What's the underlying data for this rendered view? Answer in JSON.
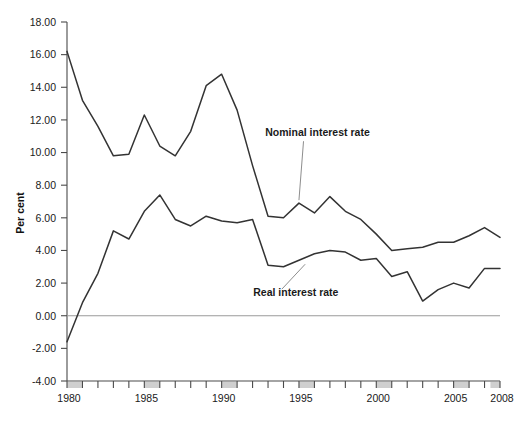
{
  "chart_data": {
    "type": "line",
    "title": "",
    "xlabel": "",
    "ylabel": "Per cent",
    "ylim": [
      -4.0,
      18.0
    ],
    "xlim": [
      1980,
      2008
    ],
    "ytick_step": 2.0,
    "grid": false,
    "legend_position": "inline-annotations",
    "ytick_labels": [
      "18.00",
      "16.00",
      "14.00",
      "12.00",
      "10.00",
      "8.00",
      "6.00",
      "4.00",
      "2.00",
      "0.00",
      "-2.00",
      "-4.00"
    ],
    "ytick_values": [
      18,
      16,
      14,
      12,
      10,
      8,
      6,
      4,
      2,
      0,
      -2,
      -4
    ],
    "xtick_labels": [
      "1980",
      "1985",
      "1990",
      "1995",
      "2000",
      "2005",
      "2008"
    ],
    "xtick_values": [
      1980,
      1985,
      1990,
      1995,
      2000,
      2005,
      2008
    ],
    "x_minor_step": 1,
    "highlighted_years": [
      1980,
      1985,
      1990,
      1995,
      2000,
      2005,
      2008
    ],
    "x": [
      1980,
      1981,
      1982,
      1983,
      1984,
      1985,
      1986,
      1987,
      1988,
      1989,
      1990,
      1991,
      1992,
      1993,
      1994,
      1995,
      1996,
      1997,
      1998,
      1999,
      2000,
      2001,
      2002,
      2003,
      2004,
      2005,
      2006,
      2007,
      2008
    ],
    "series": [
      {
        "name": "Nominal interest rate",
        "color": "#333333",
        "values": [
          16.2,
          13.2,
          11.6,
          9.8,
          9.9,
          12.3,
          10.4,
          9.8,
          11.3,
          14.1,
          14.8,
          12.6,
          9.2,
          6.1,
          6.0,
          6.9,
          6.3,
          7.3,
          6.4,
          5.9,
          5.0,
          4.0,
          4.1,
          4.2,
          4.5,
          4.5,
          4.9,
          5.4,
          4.8
        ]
      },
      {
        "name": "Real interest rate",
        "color": "#333333",
        "values": [
          -1.6,
          0.8,
          2.6,
          5.2,
          4.7,
          6.4,
          7.4,
          5.9,
          5.5,
          6.1,
          5.8,
          5.7,
          5.9,
          3.1,
          3.0,
          3.4,
          3.8,
          4.0,
          3.9,
          3.4,
          3.5,
          2.4,
          2.7,
          0.9,
          1.6,
          2.0,
          1.7,
          2.9,
          2.9
        ]
      }
    ],
    "annotations": [
      {
        "text": "Nominal interest rate",
        "anchor_x": 1996.2,
        "anchor_y": 11.0,
        "leader_to_x": 1995.0,
        "leader_to_y": 6.9
      },
      {
        "text": "Real interest rate",
        "anchor_x": 1994.8,
        "anchor_y": 1.2,
        "leader_to_x": 1995.4,
        "leader_to_y": 3.4
      }
    ]
  }
}
